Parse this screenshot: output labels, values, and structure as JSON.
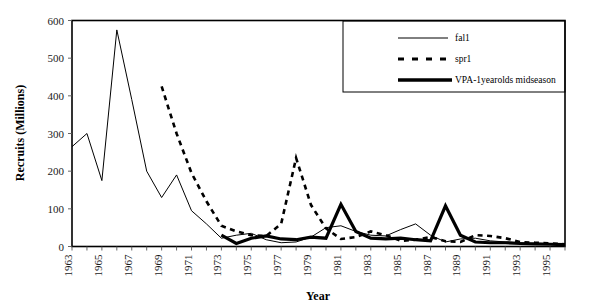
{
  "chart_data": {
    "type": "line",
    "title": "",
    "xlabel": "Year",
    "ylabel": "Recruits (Millions)",
    "xlim": [
      1963,
      1996
    ],
    "ylim": [
      0,
      600
    ],
    "grid": false,
    "legend_position": "top-right",
    "x_tick_labels": [
      "1963",
      "1965",
      "1967",
      "1969",
      "1971",
      "1973",
      "1975",
      "1977",
      "1979",
      "1981",
      "1983",
      "1985",
      "1987",
      "1989",
      "1991",
      "1993",
      "1995"
    ],
    "y_tick_labels": [
      "0",
      "100",
      "200",
      "300",
      "400",
      "500",
      "600"
    ],
    "y_ticks": [
      0,
      100,
      200,
      300,
      400,
      500,
      600
    ],
    "x": [
      1963,
      1964,
      1965,
      1966,
      1967,
      1968,
      1969,
      1970,
      1971,
      1972,
      1973,
      1974,
      1975,
      1976,
      1977,
      1978,
      1979,
      1980,
      1981,
      1982,
      1983,
      1984,
      1985,
      1986,
      1987,
      1988,
      1989,
      1990,
      1991,
      1992,
      1993,
      1994,
      1995,
      1996
    ],
    "series": [
      {
        "name": "fal1",
        "style": "thin-solid",
        "color": "#000000",
        "x": [
          1963,
          1964,
          1965,
          1966,
          1967,
          1968,
          1969,
          1970,
          1971,
          1972,
          1973,
          1974,
          1975,
          1976,
          1977,
          1978,
          1979,
          1980,
          1981,
          1982,
          1983,
          1984,
          1985,
          1986,
          1987,
          1988,
          1989,
          1990,
          1991,
          1992,
          1993,
          1994,
          1995,
          1996
        ],
        "values": [
          265,
          300,
          175,
          575,
          390,
          200,
          130,
          190,
          95,
          60,
          22,
          30,
          35,
          18,
          10,
          12,
          25,
          50,
          55,
          40,
          30,
          28,
          45,
          60,
          30,
          12,
          20,
          22,
          15,
          12,
          10,
          8,
          6,
          5
        ]
      },
      {
        "name": "spr1",
        "style": "thick-dashed",
        "color": "#000000",
        "x": [
          1969,
          1970,
          1971,
          1972,
          1973,
          1974,
          1975,
          1976,
          1977,
          1978,
          1979,
          1980,
          1981,
          1982,
          1983,
          1984,
          1985,
          1986,
          1987,
          1988,
          1989,
          1990,
          1991,
          1992,
          1993,
          1994,
          1995,
          1996
        ],
        "values": [
          425,
          300,
          195,
          120,
          55,
          40,
          30,
          28,
          60,
          235,
          110,
          48,
          20,
          25,
          40,
          30,
          15,
          18,
          25,
          14,
          12,
          30,
          28,
          22,
          12,
          10,
          8,
          6
        ]
      },
      {
        "name": "VPA-1yearolds midseason",
        "style": "thick-solid",
        "color": "#000000",
        "x": [
          1973,
          1974,
          1975,
          1976,
          1977,
          1978,
          1979,
          1980,
          1981,
          1982,
          1983,
          1984,
          1985,
          1986,
          1987,
          1988,
          1989,
          1990,
          1991,
          1992,
          1993,
          1994,
          1995,
          1996
        ],
        "values": [
          30,
          8,
          22,
          28,
          20,
          18,
          25,
          22,
          112,
          40,
          22,
          20,
          22,
          18,
          15,
          108,
          30,
          12,
          10,
          10,
          8,
          7,
          6,
          5
        ]
      }
    ],
    "legend": [
      {
        "label": "fal1",
        "style": "thin-solid"
      },
      {
        "label": "spr1",
        "style": "thick-dashed"
      },
      {
        "label": "VPA-1yearolds midseason",
        "style": "thick-solid"
      }
    ]
  }
}
